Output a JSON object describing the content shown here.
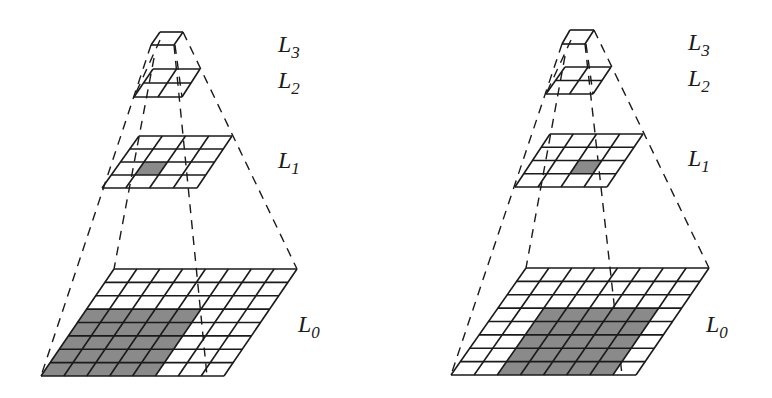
{
  "colors": {
    "line": "#1a1a1a",
    "shade": "#8a8a8a",
    "background": "#ffffff"
  },
  "panels": [
    {
      "id": "left",
      "levels": [
        {
          "name": "L3",
          "rows": 1,
          "cols": 1,
          "tl": [
            160,
            32
          ],
          "tr": [
            183,
            32
          ],
          "bl": [
            151,
            45
          ],
          "br": [
            174,
            45
          ],
          "shaded": []
        },
        {
          "name": "L2",
          "rows": 2,
          "cols": 2,
          "tl": [
            153,
            69
          ],
          "tr": [
            200,
            69
          ],
          "bl": [
            134,
            97
          ],
          "br": [
            182,
            97
          ],
          "shaded": []
        },
        {
          "name": "L1",
          "rows": 4,
          "cols": 4,
          "tl": [
            139,
            136
          ],
          "tr": [
            232,
            136
          ],
          "bl": [
            102,
            188
          ],
          "br": [
            197,
            188
          ],
          "shaded": [
            [
              2,
              1
            ]
          ]
        },
        {
          "name": "L0",
          "rows": 8,
          "cols": 8,
          "tl": [
            114,
            269
          ],
          "tr": [
            297,
            269
          ],
          "bl": [
            41,
            376
          ],
          "br": [
            224,
            376
          ],
          "shaded": [
            [
              3,
              0
            ],
            [
              3,
              1
            ],
            [
              3,
              2
            ],
            [
              3,
              3
            ],
            [
              3,
              4
            ],
            [
              4,
              0
            ],
            [
              4,
              1
            ],
            [
              4,
              2
            ],
            [
              4,
              3
            ],
            [
              4,
              4
            ],
            [
              5,
              0
            ],
            [
              5,
              1
            ],
            [
              5,
              2
            ],
            [
              5,
              3
            ],
            [
              5,
              4
            ],
            [
              6,
              0
            ],
            [
              6,
              1
            ],
            [
              6,
              2
            ],
            [
              6,
              3
            ],
            [
              6,
              4
            ],
            [
              7,
              0
            ],
            [
              7,
              1
            ],
            [
              7,
              2
            ],
            [
              7,
              3
            ],
            [
              7,
              4
            ]
          ]
        }
      ],
      "dashed_lines": [
        [
          [
            151,
            45
          ],
          [
            41,
            376
          ]
        ],
        [
          [
            183,
            32
          ],
          [
            297,
            269
          ]
        ],
        [
          [
            154,
            58
          ],
          [
            114,
            269
          ]
        ],
        [
          [
            174,
            45
          ],
          [
            207,
            376
          ]
        ],
        [
          [
            160,
            40
          ],
          [
            134,
            97
          ]
        ],
        [
          [
            175,
            45
          ],
          [
            182,
            97
          ]
        ]
      ],
      "labels": [
        {
          "text": "L",
          "sub": "3",
          "x": 278,
          "y": 32
        },
        {
          "text": "L",
          "sub": "2",
          "x": 278,
          "y": 68
        },
        {
          "text": "L",
          "sub": "1",
          "x": 278,
          "y": 148
        },
        {
          "text": "L",
          "sub": "0",
          "x": 298,
          "y": 312
        }
      ]
    },
    {
      "id": "right",
      "levels": [
        {
          "name": "L3",
          "rows": 1,
          "cols": 1,
          "tl": [
            570,
            30
          ],
          "tr": [
            594,
            30
          ],
          "bl": [
            562,
            44
          ],
          "br": [
            585,
            44
          ],
          "shaded": []
        },
        {
          "name": "L2",
          "rows": 2,
          "cols": 2,
          "tl": [
            565,
            67
          ],
          "tr": [
            611,
            67
          ],
          "bl": [
            546,
            94
          ],
          "br": [
            593,
            94
          ],
          "shaded": []
        },
        {
          "name": "L1",
          "rows": 4,
          "cols": 4,
          "tl": [
            550,
            134
          ],
          "tr": [
            643,
            134
          ],
          "bl": [
            515,
            187
          ],
          "br": [
            607,
            187
          ],
          "shaded": [
            [
              2,
              2
            ]
          ]
        },
        {
          "name": "L0",
          "rows": 8,
          "cols": 8,
          "tl": [
            526,
            268
          ],
          "tr": [
            709,
            268
          ],
          "bl": [
            451,
            375
          ],
          "br": [
            636,
            375
          ],
          "shaded": [
            [
              3,
              2
            ],
            [
              3,
              3
            ],
            [
              3,
              4
            ],
            [
              3,
              5
            ],
            [
              3,
              6
            ],
            [
              4,
              2
            ],
            [
              4,
              3
            ],
            [
              4,
              4
            ],
            [
              4,
              5
            ],
            [
              4,
              6
            ],
            [
              5,
              2
            ],
            [
              5,
              3
            ],
            [
              5,
              4
            ],
            [
              5,
              5
            ],
            [
              5,
              6
            ],
            [
              6,
              2
            ],
            [
              6,
              3
            ],
            [
              6,
              4
            ],
            [
              6,
              5
            ],
            [
              6,
              6
            ],
            [
              7,
              2
            ],
            [
              7,
              3
            ],
            [
              7,
              4
            ],
            [
              7,
              5
            ],
            [
              7,
              6
            ]
          ]
        }
      ],
      "dashed_lines": [
        [
          [
            562,
            44
          ],
          [
            451,
            375
          ]
        ],
        [
          [
            594,
            30
          ],
          [
            709,
            268
          ]
        ],
        [
          [
            565,
            56
          ],
          [
            526,
            268
          ]
        ],
        [
          [
            585,
            44
          ],
          [
            622,
            375
          ]
        ],
        [
          [
            571,
            40
          ],
          [
            546,
            94
          ]
        ],
        [
          [
            586,
            44
          ],
          [
            593,
            94
          ]
        ]
      ],
      "labels": [
        {
          "text": "L",
          "sub": "3",
          "x": 688,
          "y": 30
        },
        {
          "text": "L",
          "sub": "2",
          "x": 688,
          "y": 66
        },
        {
          "text": "L",
          "sub": "1",
          "x": 688,
          "y": 146
        },
        {
          "text": "L",
          "sub": "0",
          "x": 706,
          "y": 312
        }
      ]
    }
  ]
}
